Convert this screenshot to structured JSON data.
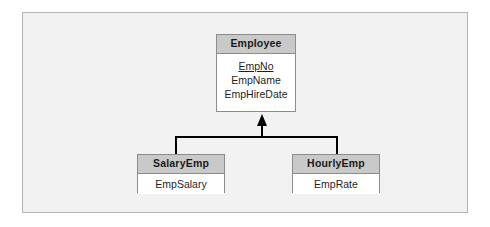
{
  "diagram": {
    "type": "generalization-hierarchy",
    "notation": "EER / UML class inheritance",
    "colors": {
      "frame_background": "#f2f2f2",
      "frame_border": "#b4b4b4",
      "entity_header_fill": "#c9c9c9",
      "entity_body_fill": "#ffffff",
      "entity_border": "#8c8c8c",
      "connector": "#000000"
    },
    "superclass": {
      "name": "Employee",
      "attributes": [
        {
          "label": "EmpNo",
          "primary_key": true
        },
        {
          "label": "EmpName",
          "primary_key": false
        },
        {
          "label": "EmpHireDate",
          "primary_key": false
        }
      ]
    },
    "subclasses": [
      {
        "name": "SalaryEmp",
        "attributes": [
          {
            "label": "EmpSalary",
            "primary_key": false
          }
        ]
      },
      {
        "name": "HourlyEmp",
        "attributes": [
          {
            "label": "EmpRate",
            "primary_key": false
          }
        ]
      }
    ],
    "connector": {
      "arrow_style": "solid-filled-triangle",
      "points_to": "Employee",
      "branches_to": [
        "SalaryEmp",
        "HourlyEmp"
      ]
    }
  }
}
